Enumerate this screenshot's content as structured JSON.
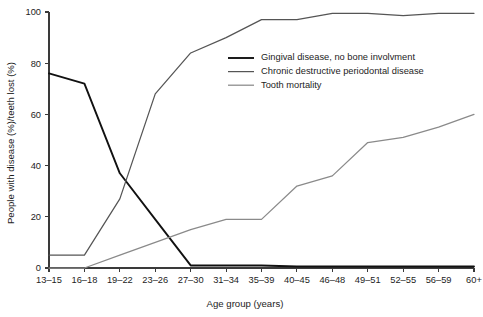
{
  "chart_data": {
    "type": "line",
    "title": "",
    "xlabel": "Age group (years)",
    "ylabel": "People with disease (%)/teeth lost (%)",
    "categories": [
      "13–15",
      "16–18",
      "19–22",
      "23–26",
      "27–30",
      "31–34",
      "35–39",
      "40–45",
      "46–48",
      "49–51",
      "52–55",
      "56–59",
      "60+"
    ],
    "ylim": [
      0,
      100
    ],
    "yticks": [
      0,
      20,
      40,
      60,
      80,
      100
    ],
    "yticklabels": [
      "0",
      "20",
      "40",
      "60",
      "80",
      "100"
    ],
    "grid": false,
    "legend_position": "upper-center-right",
    "series": [
      {
        "name": "Gingival disease, no bone involvment",
        "color": "#111111",
        "width": 1.9,
        "values": [
          76,
          72,
          37,
          19,
          1,
          1,
          1,
          0.6,
          0.6,
          0.6,
          0.6,
          0.6,
          0.6
        ]
      },
      {
        "name": "Chronic destructive periodontal disease",
        "color": "#555555",
        "width": 1.25,
        "values": [
          5,
          5,
          27,
          68,
          84,
          90,
          97,
          97,
          99.5,
          99.5,
          98.6,
          99.5,
          99.5
        ]
      },
      {
        "name": "Tooth mortality",
        "color": "#8a8a8a",
        "width": 1.25,
        "values": [
          0,
          0,
          5,
          10,
          15,
          19,
          19,
          32,
          36,
          49,
          51,
          55,
          60
        ]
      }
    ]
  },
  "legend": {
    "items": [
      {
        "label": "Gingival disease, no bone involvment",
        "color": "#111111",
        "width": 1.9
      },
      {
        "label": "Chronic destructive periodontal disease",
        "color": "#555555",
        "width": 1.25
      },
      {
        "label": "Tooth mortality",
        "color": "#8a8a8a",
        "width": 1.25
      }
    ]
  }
}
